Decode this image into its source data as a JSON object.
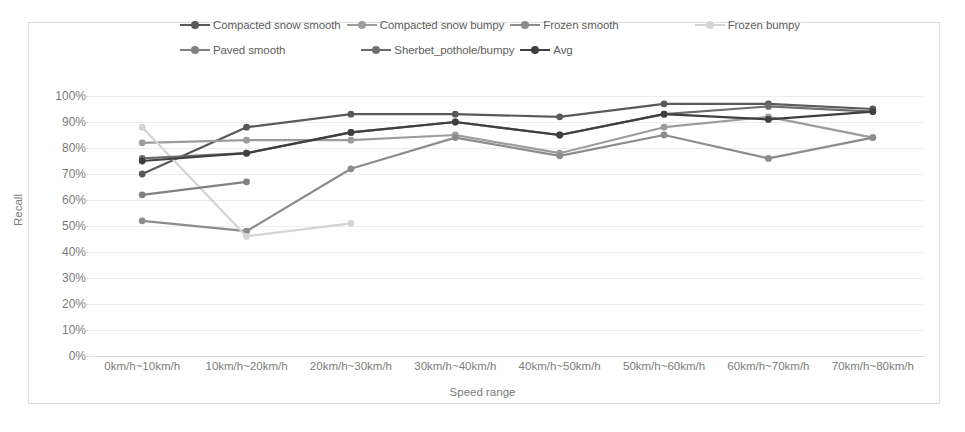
{
  "chart_data": {
    "type": "line",
    "title": "",
    "xlabel": "Speed range",
    "ylabel": "Recall",
    "ylim": [
      0,
      100
    ],
    "ytick_labels": [
      "100%",
      "90%",
      "80%",
      "70%",
      "60%",
      "50%",
      "40%",
      "30%",
      "20%",
      "10%",
      "0%"
    ],
    "ytick_values": [
      100,
      90,
      80,
      70,
      60,
      50,
      40,
      30,
      20,
      10,
      0
    ],
    "grid": true,
    "legend_position": "top",
    "categories": [
      "0km/h~10km/h",
      "10km/h~20km/h",
      "20km/h~30km/h",
      "30km/h~40km/h",
      "40km/h~50km/h",
      "50km/h~60km/h",
      "60km/h~70km/h",
      "70km/h~80km/h"
    ],
    "series": [
      {
        "name": "Compacted snow smooth",
        "color": "#595959",
        "values": [
          70,
          88,
          93,
          93,
          92,
          97,
          97,
          95
        ]
      },
      {
        "name": "Compacted snow bumpy",
        "color": "#9c9c9c",
        "values": [
          82,
          83,
          83,
          85,
          78,
          88,
          92,
          84
        ]
      },
      {
        "name": "Frozen smooth",
        "color": "#8c8c8c",
        "values": [
          52,
          48,
          72,
          84,
          77,
          85,
          76,
          84
        ]
      },
      {
        "name": "Frozen bumpy",
        "color": "#d4d4d4",
        "values": [
          88,
          46,
          51,
          null,
          null,
          null,
          null,
          null
        ]
      },
      {
        "name": "Paved smooth",
        "color": "#808080",
        "values": [
          62,
          67,
          null,
          null,
          null,
          null,
          null,
          null
        ]
      },
      {
        "name": "Sherbet_pothole/bumpy",
        "color": "#6e6e6e",
        "values": [
          76,
          78,
          86,
          90,
          85,
          93,
          96,
          94
        ]
      },
      {
        "name": "Avg",
        "color": "#3f3f3f",
        "values": [
          75,
          78,
          86,
          90,
          85,
          93,
          91,
          94
        ]
      }
    ]
  },
  "axes": {
    "y_title": "Recall",
    "x_title": "Speed range"
  }
}
